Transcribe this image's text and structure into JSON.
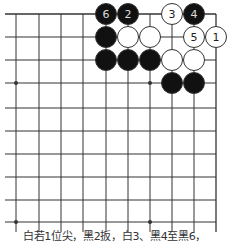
{
  "diagram": {
    "type": "go-board-corner",
    "corner": "top-right",
    "grid": {
      "cols": 10,
      "rows": 10,
      "col_x": [
        16,
        39,
        61,
        83,
        106,
        128,
        150,
        172,
        194,
        216
      ],
      "row_y": [
        14,
        37,
        60,
        83,
        108,
        131,
        154,
        177,
        200,
        222
      ],
      "left_extend_x": 5,
      "bottom_extend_y": 232,
      "line_color": "#333333",
      "star_points": [
        [
          0,
          3
        ],
        [
          6,
          3
        ],
        [
          0,
          9
        ],
        [
          6,
          9
        ]
      ]
    },
    "stone_radius": 10.5,
    "stones": [
      {
        "color": "black",
        "col": 4,
        "row": 0,
        "label": "6"
      },
      {
        "color": "black",
        "col": 5,
        "row": 0,
        "label": "2"
      },
      {
        "color": "white",
        "col": 7,
        "row": 0,
        "label": "3"
      },
      {
        "color": "black",
        "col": 8,
        "row": 0,
        "label": "4"
      },
      {
        "color": "black",
        "col": 4,
        "row": 1,
        "label": ""
      },
      {
        "color": "white",
        "col": 5,
        "row": 1,
        "label": ""
      },
      {
        "color": "white",
        "col": 6,
        "row": 1,
        "label": ""
      },
      {
        "color": "white",
        "col": 8,
        "row": 1,
        "label": "5"
      },
      {
        "color": "white",
        "col": 9,
        "row": 1,
        "label": "1"
      },
      {
        "color": "black",
        "col": 4,
        "row": 2,
        "label": ""
      },
      {
        "color": "black",
        "col": 5,
        "row": 2,
        "label": ""
      },
      {
        "color": "black",
        "col": 6,
        "row": 2,
        "label": ""
      },
      {
        "color": "white",
        "col": 7,
        "row": 2,
        "label": ""
      },
      {
        "color": "white",
        "col": 8,
        "row": 2,
        "label": ""
      },
      {
        "color": "black",
        "col": 7,
        "row": 3,
        "label": ""
      },
      {
        "color": "black",
        "col": 8,
        "row": 3,
        "label": ""
      }
    ],
    "colors": {
      "black_stone": "#111111",
      "white_stone": "#ffffff",
      "stone_outline": "#333333",
      "black_label": "#dddddd",
      "white_label": "#222222"
    }
  },
  "caption": "白若1位尖，黑2扳，白3、黑4至黑6，"
}
